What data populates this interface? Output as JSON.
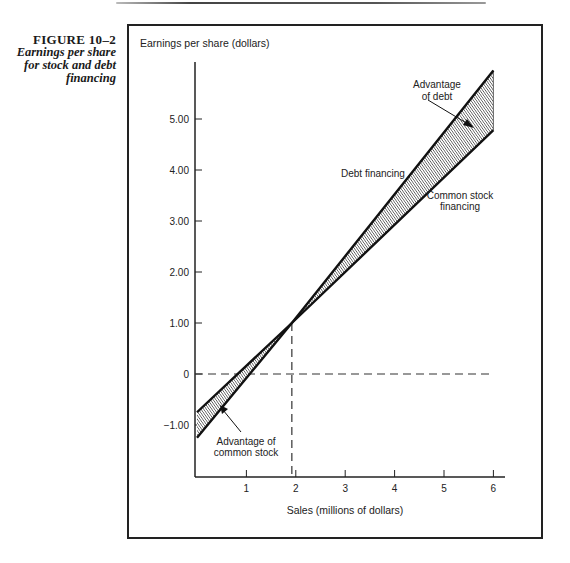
{
  "figure": {
    "number": "FIGURE 10–2",
    "caption_lines": [
      "Earnings per share",
      "for stock and debt",
      "financing"
    ]
  },
  "chart_data": {
    "type": "line",
    "title": "Earnings per share for stock and debt financing",
    "xlabel": "Sales (millions of dollars)",
    "ylabel": "Earnings per share (dollars)",
    "xlim": [
      0,
      6
    ],
    "ylim": [
      -1.6,
      6.0
    ],
    "x_ticks": [
      1,
      2,
      3,
      4,
      5,
      6
    ],
    "x_tick_labels": [
      "1",
      "2",
      "3",
      "4",
      "5",
      "6"
    ],
    "y_ticks": [
      -1,
      0,
      1,
      2,
      3,
      4,
      5
    ],
    "y_tick_labels": [
      "−1.00",
      "0",
      "1.00",
      "2.00",
      "3.00",
      "4.00",
      "5.00"
    ],
    "grid": false,
    "series": [
      {
        "name": "Debt financing",
        "x": [
          0,
          1.92,
          6
        ],
        "y": [
          -1.25,
          1.0,
          5.95
        ]
      },
      {
        "name": "Common stock financing",
        "x": [
          0,
          1.92,
          6
        ],
        "y": [
          -0.75,
          1.0,
          4.78
        ]
      }
    ],
    "reference_lines": [
      {
        "type": "horizontal",
        "y": 0,
        "style": "dashed"
      },
      {
        "type": "vertical",
        "x": 1.92,
        "from_y": -1.6,
        "to_y": 1.0,
        "style": "dashed"
      }
    ],
    "shaded_regions": [
      {
        "label": "Advantage of common stock",
        "x_range": [
          0,
          1.92
        ]
      },
      {
        "label": "Advantage of debt",
        "x_range": [
          1.92,
          6
        ]
      }
    ],
    "annotations": [
      {
        "text_lines": [
          "Advantage",
          "of debt"
        ]
      },
      {
        "text_lines": [
          "Advantage of",
          "common stock"
        ]
      },
      {
        "text_lines": [
          "Debt financing"
        ]
      },
      {
        "text_lines": [
          "Common stock",
          "financing"
        ]
      }
    ],
    "break_even": {
      "sales": 1.92,
      "eps": 1.0
    }
  }
}
